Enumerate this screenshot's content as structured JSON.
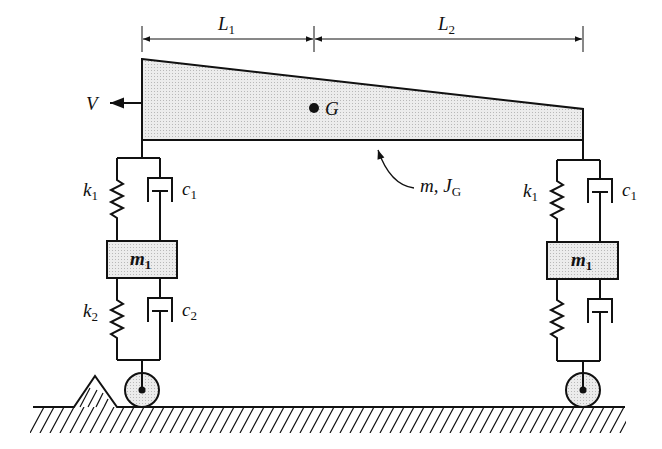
{
  "diagram": {
    "colors": {
      "line": "#111111",
      "fill": "#e4e4e4",
      "background": "#ffffff"
    },
    "dimensions": [
      {
        "label": "L",
        "sub": "1"
      },
      {
        "label": "L",
        "sub": "2"
      }
    ],
    "body": {
      "velocity_label": "V",
      "cg_label": "G",
      "mass_label": "m, J",
      "mass_sub": "G"
    },
    "left_suspension": {
      "upper_spring": {
        "label": "k",
        "sub": "1"
      },
      "upper_damper": {
        "label": "c",
        "sub": "1"
      },
      "mass": {
        "label": "m",
        "sub": "1"
      },
      "lower_spring": {
        "label": "k",
        "sub": "2"
      },
      "lower_damper": {
        "label": "c",
        "sub": "2"
      }
    },
    "right_suspension": {
      "upper_spring": {
        "label": "k",
        "sub": "1"
      },
      "upper_damper": {
        "label": "c",
        "sub": "1"
      },
      "mass": {
        "label": "m",
        "sub": "1"
      }
    }
  }
}
